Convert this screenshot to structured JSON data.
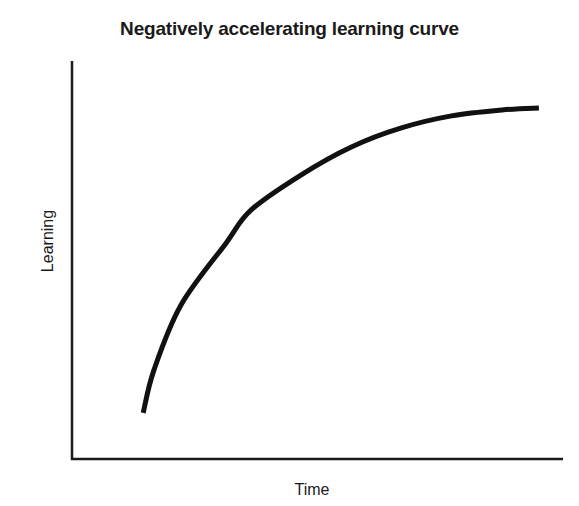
{
  "chart_data": {
    "type": "line",
    "title": "Negatively accelerating learning curve",
    "xlabel": "Time",
    "ylabel": "Learning",
    "grid": false,
    "legend": null,
    "x_ticks": [],
    "y_ticks": [],
    "xlim": [
      0,
      100
    ],
    "ylim": [
      0,
      100
    ],
    "series": [
      {
        "name": "Learning curve",
        "color": "#111111",
        "x": [
          14.5,
          16.7,
          22.2,
          31.4,
          36.5,
          46.7,
          56.9,
          67.1,
          77.3,
          87.6,
          95.1
        ],
        "y": [
          11.6,
          22.4,
          38.7,
          54.3,
          62.6,
          71.4,
          78.4,
          83.2,
          86.2,
          87.7,
          88.2
        ]
      }
    ]
  },
  "colors": {
    "axis": "#1a1a1a",
    "curve": "#111111",
    "background": "#ffffff"
  }
}
